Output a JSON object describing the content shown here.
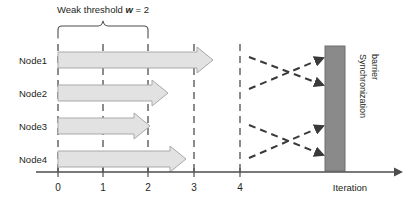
{
  "figure": {
    "title_prefix": "Weak threshold ",
    "title_var": "w",
    "title_suffix": " = 2",
    "axis_title": "Iteration",
    "barrier_label_line1": "Synchronization",
    "barrier_label_line2": "barrier",
    "nodes": [
      {
        "label": "Node1",
        "arrow_end": 3.42
      },
      {
        "label": "Node2",
        "arrow_end": 2.42
      },
      {
        "label": "Node3",
        "arrow_end": 2.02
      },
      {
        "label": "Node4",
        "arrow_end": 2.82
      }
    ],
    "ticks": [
      "0",
      "1",
      "2",
      "3",
      "4"
    ],
    "tick_values": [
      0,
      1,
      2,
      3,
      4
    ],
    "gridlines": [
      0,
      1,
      2,
      3,
      4
    ],
    "brace_span": [
      0,
      2
    ],
    "colors": {
      "arrow_fill": "#e2e2e2",
      "arrow_stroke": "#a9a9a9",
      "barrier_fill": "#8a8a8a",
      "barrier_stroke": "#6f6f6f",
      "axis": "#4d4d4d",
      "grid": "#3f3f3f",
      "text": "#231f20",
      "dashed_arrow": "#3a3a3a",
      "background": "#ffffff"
    }
  }
}
